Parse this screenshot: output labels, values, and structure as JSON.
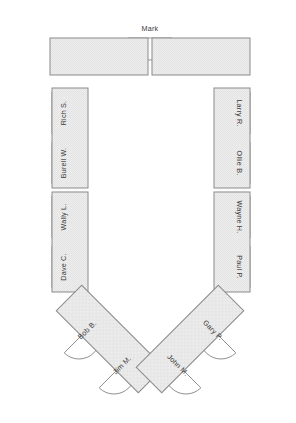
{
  "diagram": {
    "shape": "u-shaped-table-layout",
    "colors": {
      "table_fill": "#ececec",
      "table_stroke": "#8a8a8a",
      "seat_fill": "#ffffff",
      "seat_stroke": "#8a8a8a",
      "label_text": "#3a3a3a",
      "background": "#ffffff"
    },
    "tables": [
      {
        "name": "top-left-table",
        "x": 50,
        "y": 38,
        "w": 98,
        "h": 37,
        "rotation": 0
      },
      {
        "name": "top-right-table",
        "x": 152,
        "y": 38,
        "w": 98,
        "h": 37,
        "rotation": 0
      },
      {
        "name": "left-upper-table",
        "x": 52,
        "y": 88,
        "w": 36,
        "h": 100,
        "rotation": 0
      },
      {
        "name": "left-lower-table",
        "x": 52,
        "y": 192,
        "w": 36,
        "h": 100,
        "rotation": 0
      },
      {
        "name": "right-upper-table",
        "x": 214,
        "y": 88,
        "w": 36,
        "h": 100,
        "rotation": 0
      },
      {
        "name": "right-lower-table",
        "x": 214,
        "y": 192,
        "w": 36,
        "h": 100,
        "rotation": 0
      },
      {
        "name": "bottom-left-table",
        "x": 0,
        "y": 0,
        "w": 36,
        "h": 116,
        "rotation": -45,
        "cx": 110,
        "cy": 339
      },
      {
        "name": "bottom-right-table",
        "x": 0,
        "y": 0,
        "w": 36,
        "h": 116,
        "rotation": 45,
        "cx": 190,
        "cy": 339
      }
    ],
    "seats": [
      {
        "id": "seat-mark",
        "label": "Mark",
        "side": "top",
        "cx": 150,
        "cy": 38,
        "radius": 22,
        "facing": "up",
        "rotation": 0
      },
      {
        "id": "seat-rich-s",
        "label": "Rich S.",
        "side": "left",
        "cx": 52,
        "cy": 113,
        "radius": 21,
        "facing": "left",
        "rotation": -90
      },
      {
        "id": "seat-burell-w",
        "label": "Burell W.",
        "side": "left",
        "cx": 52,
        "cy": 163,
        "radius": 21,
        "facing": "left",
        "rotation": -90
      },
      {
        "id": "seat-wally-l",
        "label": "Wally L.",
        "side": "left",
        "cx": 52,
        "cy": 217,
        "radius": 21,
        "facing": "left",
        "rotation": -90
      },
      {
        "id": "seat-dave-c",
        "label": "Dave C.",
        "side": "left",
        "cx": 52,
        "cy": 267,
        "radius": 21,
        "facing": "left",
        "rotation": -90
      },
      {
        "id": "seat-larry-r",
        "label": "Larry R.",
        "side": "right",
        "cx": 250,
        "cy": 113,
        "radius": 21,
        "facing": "right",
        "rotation": 90
      },
      {
        "id": "seat-ollie-b",
        "label": "Ollie B.",
        "side": "right",
        "cx": 250,
        "cy": 163,
        "radius": 21,
        "facing": "right",
        "rotation": 90
      },
      {
        "id": "seat-wayne-h",
        "label": "Wayne H.",
        "side": "right",
        "cx": 250,
        "cy": 217,
        "radius": 21,
        "facing": "right",
        "rotation": 90
      },
      {
        "id": "seat-paul-p",
        "label": "Paul P.",
        "side": "right",
        "cx": 250,
        "cy": 267,
        "radius": 21,
        "facing": "right",
        "rotation": 90
      },
      {
        "id": "seat-bob-b",
        "label": "Bob B.",
        "side": "bottom-left",
        "cx": 79,
        "cy": 338,
        "radius": 21,
        "facing": "lower-left",
        "rotation": -45
      },
      {
        "id": "seat-jim-m",
        "label": "Jim M.",
        "side": "bottom-left",
        "cx": 114,
        "cy": 373,
        "radius": 21,
        "facing": "lower-left",
        "rotation": -45
      },
      {
        "id": "seat-gary-p",
        "label": "Gary P.",
        "side": "bottom-right",
        "cx": 221,
        "cy": 338,
        "radius": 21,
        "facing": "lower-right",
        "rotation": 45
      },
      {
        "id": "seat-john-m",
        "label": "John M.",
        "side": "bottom-right",
        "cx": 186,
        "cy": 373,
        "radius": 21,
        "facing": "lower-right",
        "rotation": 45
      }
    ]
  }
}
